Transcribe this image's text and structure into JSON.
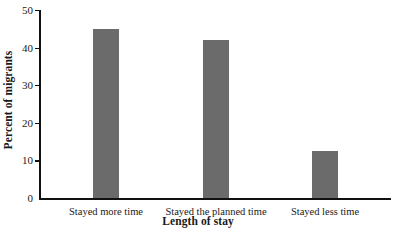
{
  "chart_data": {
    "type": "bar",
    "title": "",
    "xlabel": "Length of stay",
    "ylabel": "Percent of migrants",
    "categories": [
      "Stayed more time",
      "Stayed the planned time",
      "Stayed less time"
    ],
    "values": [
      45,
      42,
      12.5
    ],
    "ylim": [
      0,
      50
    ],
    "yticks": [
      0,
      10,
      20,
      30,
      40,
      50
    ],
    "ytick_labels": [
      "0",
      "10",
      "20",
      "30",
      "40",
      "50"
    ],
    "grid": false,
    "legend": "none",
    "bar_color": "#6b6b6b",
    "axis_color": "#111111",
    "bar_width_px": 26,
    "bar_centers_px": [
      106,
      216,
      325
    ]
  }
}
